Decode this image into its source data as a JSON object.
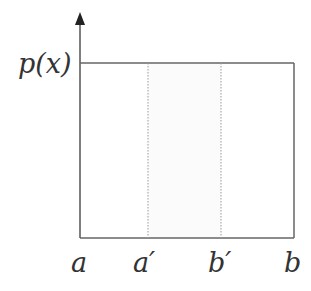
{
  "diagram": {
    "y_label": "p(x)",
    "x_labels": [
      "a",
      "a′",
      "b′",
      "b"
    ],
    "colors": {
      "axis": "#555555",
      "box": "#666666",
      "dotted": "#999999",
      "shade": "#fbfbfb",
      "text": "#333333"
    }
  }
}
